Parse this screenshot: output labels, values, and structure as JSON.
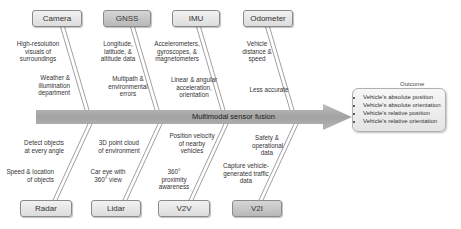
{
  "spine": {
    "label": "Multimodal sensor fusion"
  },
  "top_causes": [
    {
      "name": "Camera",
      "upper": "High-resolution visuals of surroundings",
      "lower": "Weather & illumination department"
    },
    {
      "name": "GNSS",
      "upper": "Longitude, latitude, & altitude data",
      "lower": "Multipath & environmental errors"
    },
    {
      "name": "IMU",
      "upper": "Accelerometers, gyroscopes, & magnetometers",
      "lower": "Linear & angular acceleration, orientation"
    },
    {
      "name": "Odometer",
      "upper": "Vehicle distance & speed",
      "lower": "Less accurate"
    }
  ],
  "bottom_causes": [
    {
      "name": "Radar",
      "upper": "Detect objects at every angle",
      "lower": "Speed & location of objects"
    },
    {
      "name": "Lidar",
      "upper": "3D point cloud of environment",
      "lower": "Car eye with 360° view"
    },
    {
      "name": "V2V",
      "upper": "Position velocity of nearby vehicles",
      "lower": "360° proximity awareness"
    },
    {
      "name": "V2I",
      "upper": "Safety & operational data",
      "lower": "Capture vehicle-generated traffic data"
    }
  ],
  "outcome": {
    "title": "Outcome",
    "items": [
      "Vehicle's absolute position",
      "Vehicle's absolute orientation",
      "Vehicle's relative position",
      "Vehicle's relative orientation"
    ]
  },
  "colors": {
    "spine": "#a8a8a8",
    "box_light": "#e6e6e6",
    "box_dark": "#c4c4c4"
  }
}
